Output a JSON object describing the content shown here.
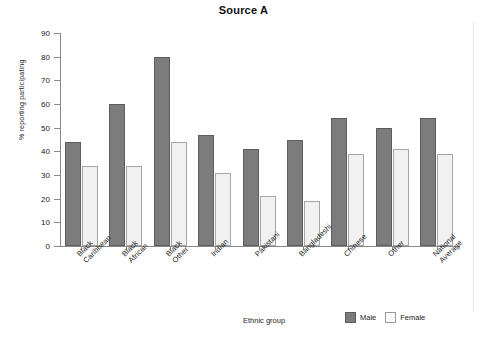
{
  "chart_data": {
    "type": "bar",
    "title": "Source A",
    "xlabel": "Ethnic group",
    "ylabel": "% reporting participating",
    "ylim": [
      0,
      90
    ],
    "ytick_step": 10,
    "yticks": [
      90,
      80,
      70,
      60,
      50,
      40,
      30,
      20,
      10,
      0
    ],
    "grid": false,
    "legend_position": "bottom-right",
    "categories": [
      "Black\nCaribbean",
      "Black\nAfrican",
      "Black\nOther",
      "Indian",
      "Pakistani",
      "Bangladeshi",
      "Chinese",
      "Other",
      "National\nAverage"
    ],
    "series": [
      {
        "name": "Male",
        "color": "#7c7c7c",
        "values": [
          44,
          60,
          80,
          47,
          41,
          45,
          54,
          50,
          54
        ]
      },
      {
        "name": "Female",
        "color": "#f1f1f1",
        "values": [
          34,
          34,
          44,
          31,
          21,
          19,
          39,
          41,
          39
        ]
      }
    ]
  },
  "legend": {
    "items": [
      {
        "label": "Male",
        "swatch": "male"
      },
      {
        "label": "Female",
        "swatch": "female"
      }
    ]
  }
}
